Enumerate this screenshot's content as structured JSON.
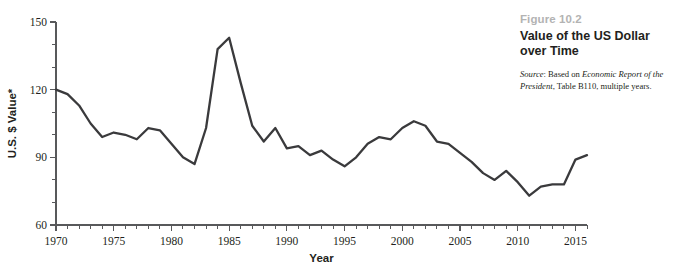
{
  "caption": {
    "figure_number": "Figure 10.2",
    "title_line1": "Value of the US Dollar",
    "title_line2": "over Time",
    "source_label": "Source",
    "source_prefix": ": Based on ",
    "source_work": "Economic Report of the President",
    "source_suffix": ", Table B110, multiple years."
  },
  "colors": {
    "line": "#3a3a3c",
    "axis": "#58595b",
    "figure_number": "#b3b3b3",
    "text": "#231f20",
    "background": "#ffffff"
  },
  "chart_data": {
    "type": "line",
    "title": "Value of the US Dollar over Time",
    "xlabel": "Year",
    "ylabel": "U.S. $ Value*",
    "xlim": [
      1970,
      2016
    ],
    "ylim": [
      60,
      150
    ],
    "yticks": [
      60,
      90,
      120,
      150
    ],
    "ytick_labels": [
      "60",
      "90",
      "120",
      "150"
    ],
    "y_minor_tick_step": 10,
    "xticks": [
      1970,
      1975,
      1980,
      1985,
      1990,
      1995,
      2000,
      2005,
      2010,
      2015
    ],
    "xtick_labels": [
      "1970",
      "1975",
      "1980",
      "1985",
      "1990",
      "1995",
      "2000",
      "2005",
      "2010",
      "2015"
    ],
    "x_minor_tick_step": 1,
    "grid": false,
    "legend": false,
    "series": [
      {
        "name": "U.S. Dollar Value Index",
        "x": [
          1970,
          1971,
          1972,
          1973,
          1974,
          1975,
          1976,
          1977,
          1978,
          1979,
          1980,
          1981,
          1982,
          1983,
          1984,
          1985,
          1986,
          1987,
          1988,
          1989,
          1990,
          1991,
          1992,
          1993,
          1994,
          1995,
          1996,
          1997,
          1998,
          1999,
          2000,
          2001,
          2002,
          2003,
          2004,
          2005,
          2006,
          2007,
          2008,
          2009,
          2010,
          2011,
          2012,
          2013,
          2014,
          2015,
          2016
        ],
        "values": [
          120,
          118,
          113,
          105,
          99,
          101,
          100,
          98,
          103,
          102,
          96,
          90,
          87,
          103,
          138,
          143,
          123,
          104,
          97,
          103,
          94,
          95,
          91,
          93,
          89,
          86,
          90,
          96,
          99,
          98,
          103,
          106,
          104,
          97,
          96,
          92,
          88,
          83,
          80,
          84,
          79,
          73,
          77,
          78,
          78,
          89,
          91
        ]
      }
    ]
  }
}
